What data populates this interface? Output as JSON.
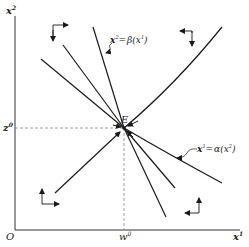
{
  "diagram": {
    "type": "phase-diagram",
    "axes": {
      "origin_label": "O",
      "x_label": "x",
      "x_label_sup": "1",
      "y_label": "x",
      "y_label_sup": "2"
    },
    "equilibrium": {
      "point_label": "E",
      "x_value_label": "w",
      "x_value_sup": "0",
      "y_value_label": "z",
      "y_value_sup": "0"
    },
    "curves": [
      {
        "id": "beta",
        "label": "x² = β(x¹)",
        "label_lhs": "x",
        "label_lhs_sup": "2",
        "label_eq": "=",
        "label_rhs": "β(x",
        "label_rhs_sup": "1",
        "label_close": ")"
      },
      {
        "id": "alpha",
        "label": "x¹ = α(x²)",
        "label_lhs": "x",
        "label_lhs_sup": "1",
        "label_eq": "=",
        "label_rhs": "α(x",
        "label_rhs_sup": "2",
        "label_close": ")"
      }
    ],
    "direction_arrows": [
      {
        "region": "top-left",
        "horizontal": "right",
        "vertical": "down"
      },
      {
        "region": "top-right",
        "horizontal": "left",
        "vertical": "down"
      },
      {
        "region": "bottom-left",
        "horizontal": "right",
        "vertical": "up"
      },
      {
        "region": "bottom-right",
        "horizontal": "left",
        "vertical": "up"
      }
    ],
    "colors": {
      "line": "#1a1a1a",
      "dashed": "#888888",
      "background": "#ffffff"
    }
  }
}
